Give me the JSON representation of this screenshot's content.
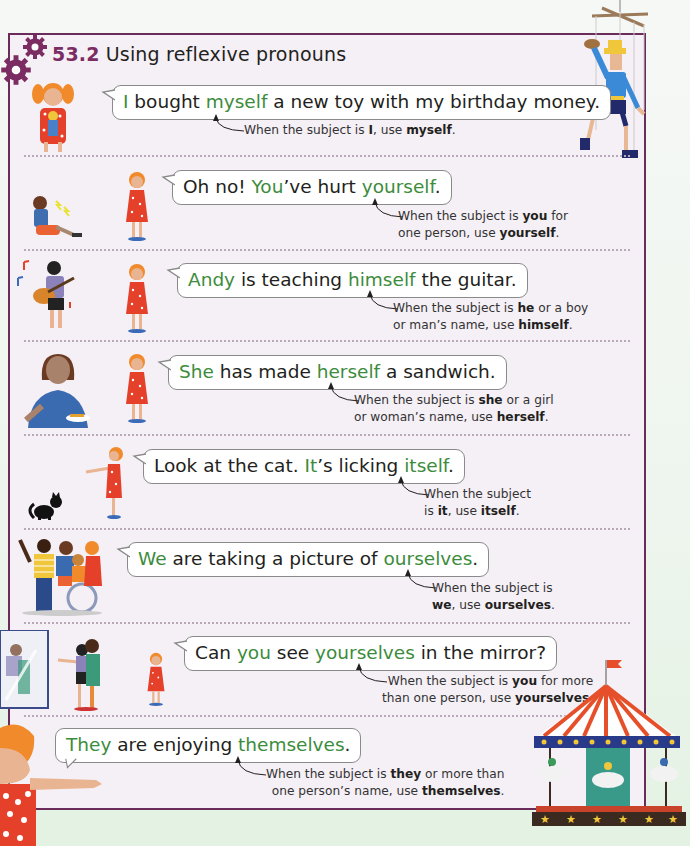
{
  "page": {
    "section_number": "53.2",
    "title": "Using reflexive pronouns",
    "colors": {
      "frame_border": "#6b2c5c",
      "frame_bg": "#f5eff6",
      "highlight_green": "#3c8c3c",
      "page_bg": "#e3f2e3"
    }
  },
  "examples": [
    {
      "sentence_parts": [
        {
          "text": "I",
          "highlight": true
        },
        {
          "text": " bought ",
          "highlight": false
        },
        {
          "text": "myself",
          "highlight": true
        },
        {
          "text": " a new toy with my birthday money.",
          "highlight": false
        }
      ],
      "note_parts": [
        {
          "text": "When the subject is ",
          "bold": false
        },
        {
          "text": "I",
          "bold": false
        },
        {
          "text": ", use ",
          "bold": false
        },
        {
          "text": "myself",
          "bold": true
        },
        {
          "text": ".",
          "bold": false
        }
      ],
      "illustration": "girl-holding-toy"
    },
    {
      "sentence_parts": [
        {
          "text": "Oh no! ",
          "highlight": false
        },
        {
          "text": "You",
          "highlight": true
        },
        {
          "text": "’ve hurt ",
          "highlight": false
        },
        {
          "text": "yourself",
          "highlight": true
        },
        {
          "text": ".",
          "highlight": false
        }
      ],
      "note_line1": [
        {
          "text": "When the subject is ",
          "bold": false
        },
        {
          "text": "you",
          "bold": true
        },
        {
          "text": " for",
          "bold": false
        }
      ],
      "note_line2": [
        {
          "text": "one person, use ",
          "bold": false
        },
        {
          "text": "yourself",
          "bold": true
        },
        {
          "text": ".",
          "bold": false
        }
      ],
      "illustration": "hurt-child"
    },
    {
      "sentence_parts": [
        {
          "text": "Andy",
          "highlight": true
        },
        {
          "text": " is teaching ",
          "highlight": false
        },
        {
          "text": "himself",
          "highlight": true
        },
        {
          "text": " the guitar.",
          "highlight": false
        }
      ],
      "note_line1": [
        {
          "text": "When the subject is ",
          "bold": false
        },
        {
          "text": "he",
          "bold": true
        },
        {
          "text": " or a boy",
          "bold": false
        }
      ],
      "note_line2": [
        {
          "text": "or man’s name, use ",
          "bold": false
        },
        {
          "text": "himself",
          "bold": true
        },
        {
          "text": ".",
          "bold": false
        }
      ],
      "illustration": "boy-with-guitar"
    },
    {
      "sentence_parts": [
        {
          "text": "She",
          "highlight": true
        },
        {
          "text": " has made ",
          "highlight": false
        },
        {
          "text": "herself",
          "highlight": true
        },
        {
          "text": " a sandwich.",
          "highlight": false
        }
      ],
      "note_line1": [
        {
          "text": "When the subject is ",
          "bold": false
        },
        {
          "text": "she",
          "bold": true
        },
        {
          "text": " or a girl",
          "bold": false
        }
      ],
      "note_line2": [
        {
          "text": "or woman’s name, use ",
          "bold": false
        },
        {
          "text": "herself",
          "bold": true
        },
        {
          "text": ".",
          "bold": false
        }
      ],
      "illustration": "woman-with-sandwich"
    },
    {
      "sentence_parts": [
        {
          "text": "Look at the cat. ",
          "highlight": false
        },
        {
          "text": "It",
          "highlight": true
        },
        {
          "text": "’s licking ",
          "highlight": false
        },
        {
          "text": "itself",
          "highlight": true
        },
        {
          "text": ".",
          "highlight": false
        }
      ],
      "note_line1": [
        {
          "text": "When the subject",
          "bold": false
        }
      ],
      "note_line2": [
        {
          "text": "is ",
          "bold": false
        },
        {
          "text": "it",
          "bold": true
        },
        {
          "text": ", use ",
          "bold": false
        },
        {
          "text": "itself",
          "bold": true
        },
        {
          "text": ".",
          "bold": false
        }
      ],
      "illustration": "black-cat"
    },
    {
      "sentence_parts": [
        {
          "text": "We",
          "highlight": true
        },
        {
          "text": " are taking a picture of ",
          "highlight": false
        },
        {
          "text": "ourselves",
          "highlight": true
        },
        {
          "text": ".",
          "highlight": false
        }
      ],
      "note_line1": [
        {
          "text": "When the subject is",
          "bold": false
        }
      ],
      "note_line2": [
        {
          "text": "we",
          "bold": true
        },
        {
          "text": ", use ",
          "bold": false
        },
        {
          "text": "ourselves",
          "bold": true
        },
        {
          "text": ".",
          "bold": false
        }
      ],
      "illustration": "group-selfie"
    },
    {
      "sentence_parts": [
        {
          "text": "Can ",
          "highlight": false
        },
        {
          "text": "you",
          "highlight": true
        },
        {
          "text": " see ",
          "highlight": false
        },
        {
          "text": "yourselves",
          "highlight": true
        },
        {
          "text": " in the mirror?",
          "highlight": false
        }
      ],
      "note_line1": [
        {
          "text": "When the subject is ",
          "bold": false
        },
        {
          "text": "you",
          "bold": true
        },
        {
          "text": " for more",
          "bold": false
        }
      ],
      "note_line2": [
        {
          "text": "than one person, use ",
          "bold": false
        },
        {
          "text": "yourselves",
          "bold": true
        },
        {
          "text": ".",
          "bold": false
        }
      ],
      "illustration": "children-at-mirror"
    },
    {
      "sentence_parts": [
        {
          "text": "They",
          "highlight": true
        },
        {
          "text": " are enjoying ",
          "highlight": false
        },
        {
          "text": "themselves",
          "highlight": true
        },
        {
          "text": ".",
          "highlight": false
        }
      ],
      "note_line1": [
        {
          "text": "When the subject is ",
          "bold": false
        },
        {
          "text": "they",
          "bold": true
        },
        {
          "text": " or more than",
          "bold": false
        }
      ],
      "note_line2": [
        {
          "text": "one person’s name, use ",
          "bold": false
        },
        {
          "text": "themselves",
          "bold": true
        },
        {
          "text": ".",
          "bold": false
        }
      ],
      "illustration": "carousel"
    }
  ]
}
